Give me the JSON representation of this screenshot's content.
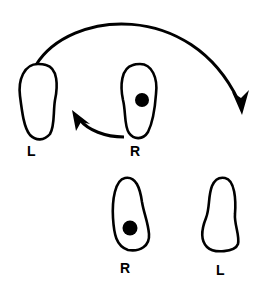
{
  "diagram": {
    "colors": {
      "stroke": "#000000",
      "background": "#ffffff"
    },
    "feet": [
      {
        "id": "top-left",
        "label": "L",
        "has_dot": false
      },
      {
        "id": "top-right",
        "label": "R",
        "has_dot": true
      },
      {
        "id": "bottom-left",
        "label": "R",
        "has_dot": true
      },
      {
        "id": "bottom-right",
        "label": "L",
        "has_dot": false
      }
    ],
    "arrows": [
      {
        "id": "long-arc",
        "from": "top-left L",
        "to": "right side (down)"
      },
      {
        "id": "short-curve",
        "from": "top R",
        "to": "top L (leftward)"
      }
    ]
  }
}
